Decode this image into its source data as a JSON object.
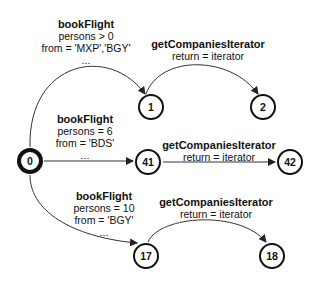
{
  "nodes": [
    {
      "id": "0",
      "x": 30,
      "y": 161,
      "initial": true
    },
    {
      "id": "1",
      "x": 151,
      "y": 107
    },
    {
      "id": "2",
      "x": 263,
      "y": 107
    },
    {
      "id": "41",
      "x": 148,
      "y": 162
    },
    {
      "id": "42",
      "x": 290,
      "y": 162
    },
    {
      "id": "17",
      "x": 146,
      "y": 256
    },
    {
      "id": "18",
      "x": 272,
      "y": 256
    }
  ],
  "edges": [
    {
      "from": "0",
      "to": "1",
      "label": {
        "title": "bookFlight",
        "lines": [
          "persons > 0",
          "from = 'MXP','BGY'",
          "..."
        ]
      }
    },
    {
      "from": "1",
      "to": "2",
      "label": {
        "title": "getCompaniesIterator",
        "lines": [
          "return = iterator"
        ]
      }
    },
    {
      "from": "0",
      "to": "41",
      "label": {
        "title": "bookFlight",
        "lines": [
          "persons = 6",
          "from = 'BDS'",
          "..."
        ]
      }
    },
    {
      "from": "41",
      "to": "42",
      "label": {
        "title": "getCompaniesIterator",
        "lines": [
          "return = iterator"
        ]
      }
    },
    {
      "from": "0",
      "to": "17",
      "label": {
        "title": "bookFlight",
        "lines": [
          "persons = 10",
          "from = 'BGY'",
          "..."
        ]
      }
    },
    {
      "from": "17",
      "to": "18",
      "label": {
        "title": "getCompaniesIterator",
        "lines": [
          "return = iterator"
        ]
      }
    }
  ]
}
